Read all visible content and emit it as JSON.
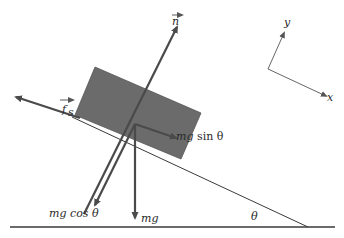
{
  "figure": {
    "colors": {
      "block": "#6b6b6b",
      "line": "#3a3a3a",
      "arrow": "#4a4a4a",
      "background": "#ffffff"
    }
  },
  "labels": {
    "normal": "n",
    "friction": "f",
    "friction_sub": "s",
    "mg_sin_m": "mg",
    "mg_sin_rest": " sin θ",
    "mg_cos": "mg cos θ",
    "mg": "mg",
    "theta": "θ",
    "axis_x": "x",
    "axis_y": "y"
  }
}
